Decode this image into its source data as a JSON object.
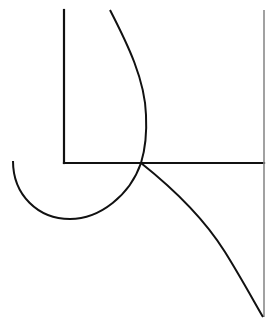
{
  "diagram": {
    "width": 269,
    "height": 331,
    "background": "#ffffff",
    "stroke_color": "#111111",
    "light_stroke_color": "#888888",
    "elements": {
      "left_vertical_line": {
        "x1": 64,
        "y1": 10,
        "x2": 64,
        "y2": 163
      },
      "horizontal_line": {
        "x1": 64,
        "y1": 163,
        "x2": 264,
        "y2": 163
      },
      "right_vertical_line": {
        "x1": 264,
        "y1": 10,
        "x2": 264,
        "y2": 317
      },
      "upper_curve": {
        "start": [
          110,
          10
        ],
        "rightmost": [
          146,
          115
        ],
        "end": [
          141,
          163
        ]
      },
      "lower_arc": {
        "start": [
          13,
          161
        ],
        "bottom": [
          70,
          219
        ],
        "end": [
          141,
          163
        ]
      },
      "descending_curve": {
        "start": [
          141,
          163
        ],
        "end": [
          263,
          317
        ]
      },
      "intersection_point": [
        141,
        163
      ]
    }
  }
}
